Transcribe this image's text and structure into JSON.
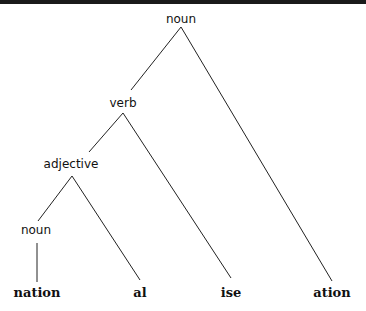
{
  "diagram": {
    "type": "morphological-tree",
    "colors": {
      "line": "#222222",
      "text": "#111111",
      "background": "#ffffff",
      "top_bar": "#1a1a1a"
    },
    "nodes": {
      "root": {
        "label": "noun",
        "x": 181,
        "y": 12
      },
      "verb": {
        "label": "verb",
        "x": 123,
        "y": 96
      },
      "adjective": {
        "label": "adjective",
        "x": 71,
        "y": 157
      },
      "noun_inner": {
        "label": "noun",
        "x": 36,
        "y": 223
      }
    },
    "leaves": [
      {
        "label": "nation",
        "x": 37,
        "y": 286
      },
      {
        "label": "al",
        "x": 140,
        "y": 286
      },
      {
        "label": "ise",
        "x": 231,
        "y": 286
      },
      {
        "label": "ation",
        "x": 332,
        "y": 286
      }
    ],
    "edges": [
      {
        "from": "root",
        "to": "verb"
      },
      {
        "from": "root",
        "to": "ation"
      },
      {
        "from": "verb",
        "to": "adjective"
      },
      {
        "from": "verb",
        "to": "ise"
      },
      {
        "from": "adjective",
        "to": "noun_inner"
      },
      {
        "from": "adjective",
        "to": "al"
      },
      {
        "from": "noun_inner",
        "to": "nation"
      }
    ]
  }
}
